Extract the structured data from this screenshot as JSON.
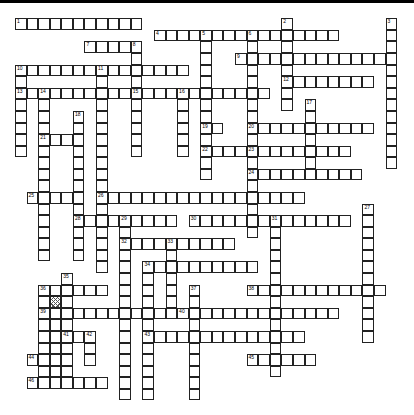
{
  "puzzle": {
    "grid": {
      "origin_x": 15,
      "origin_y": 18.3,
      "pitch": 11.58
    },
    "blocked_cells": [
      {
        "r": 24,
        "c": 3
      }
    ],
    "entries": [
      {
        "num": "1",
        "dir": "across",
        "r": 0,
        "c": 0,
        "len": 11
      },
      {
        "num": "2",
        "dir": "down",
        "r": 0,
        "c": 23,
        "len": 8
      },
      {
        "num": "3",
        "dir": "down",
        "r": 0,
        "c": 32,
        "len": 13
      },
      {
        "num": "4",
        "dir": "across",
        "r": 1,
        "c": 12,
        "len": 16
      },
      {
        "num": "5",
        "dir": "down",
        "r": 1,
        "c": 16,
        "len": 13
      },
      {
        "num": "6",
        "dir": "down",
        "r": 1,
        "c": 20,
        "len": 18
      },
      {
        "num": "7",
        "dir": "across",
        "r": 2,
        "c": 6,
        "len": 5
      },
      {
        "num": "8",
        "dir": "down",
        "r": 2,
        "c": 10,
        "len": 9
      },
      {
        "num": "9",
        "dir": "across",
        "r": 3,
        "c": 19,
        "len": 14
      },
      {
        "num": "10",
        "dir": "across",
        "r": 4,
        "c": 0,
        "len": 15
      },
      {
        "num": "11",
        "dir": "down",
        "r": 4,
        "c": 7,
        "len": 18
      },
      {
        "num": "12",
        "dir": "across",
        "r": 5,
        "c": 23,
        "len": 8
      },
      {
        "num": "13",
        "dir": "across",
        "r": 6,
        "c": 0,
        "len": 10
      },
      {
        "num": "14",
        "dir": "down",
        "r": 6,
        "c": 2,
        "len": 15
      },
      {
        "num": "15",
        "dir": "across",
        "r": 6,
        "c": 10,
        "len": 12
      },
      {
        "num": "16",
        "dir": "down",
        "r": 6,
        "c": 14,
        "len": 6
      },
      {
        "num": "17",
        "dir": "down",
        "r": 7,
        "c": 25,
        "len": 7
      },
      {
        "num": "18",
        "dir": "down",
        "r": 8,
        "c": 5,
        "len": 13
      },
      {
        "num": "19",
        "dir": "across",
        "r": 9,
        "c": 16,
        "len": 2
      },
      {
        "num": "20",
        "dir": "across",
        "r": 9,
        "c": 20,
        "len": 11
      },
      {
        "num": "21",
        "dir": "across",
        "r": 10,
        "c": 2,
        "len": 4
      },
      {
        "num": "22",
        "dir": "across",
        "r": 11,
        "c": 16,
        "len": 13
      },
      {
        "num": "23",
        "dir": "down",
        "r": 11,
        "c": 20,
        "len": 6
      },
      {
        "num": "24",
        "dir": "across",
        "r": 13,
        "c": 20,
        "len": 10
      },
      {
        "num": "25",
        "dir": "across",
        "r": 15,
        "c": 1,
        "len": 5
      },
      {
        "num": "26",
        "dir": "across",
        "r": 15,
        "c": 7,
        "len": 18
      },
      {
        "num": "27",
        "dir": "down",
        "r": 16,
        "c": 30,
        "len": 12
      },
      {
        "num": "28",
        "dir": "across",
        "r": 17,
        "c": 5,
        "len": 4
      },
      {
        "num": "29",
        "dir": "across",
        "r": 17,
        "c": 9,
        "len": 5
      },
      {
        "num": "30",
        "dir": "across",
        "r": 17,
        "c": 15,
        "len": 14
      },
      {
        "num": "31",
        "dir": "down",
        "r": 17,
        "c": 22,
        "len": 14
      },
      {
        "num": "32",
        "dir": "across",
        "r": 19,
        "c": 9,
        "len": 10
      },
      {
        "num": "33",
        "dir": "down",
        "r": 19,
        "c": 13,
        "len": 6
      },
      {
        "num": "34",
        "dir": "across",
        "r": 21,
        "c": 11,
        "len": 10
      },
      {
        "num": "35",
        "dir": "down",
        "r": 22,
        "c": 4,
        "len": 8
      },
      {
        "num": "36",
        "dir": "across",
        "r": 23,
        "c": 2,
        "len": 6
      },
      {
        "num": "37",
        "dir": "down",
        "r": 23,
        "c": 15,
        "len": 10
      },
      {
        "num": "38",
        "dir": "across",
        "r": 23,
        "c": 20,
        "len": 12
      },
      {
        "num": "39",
        "dir": "across",
        "r": 25,
        "c": 2,
        "len": 16
      },
      {
        "num": "40",
        "dir": "across",
        "r": 25,
        "c": 14,
        "len": 14
      },
      {
        "num": "41",
        "dir": "across",
        "r": 27,
        "c": 4,
        "len": 2
      },
      {
        "num": "42",
        "dir": "down",
        "r": 27,
        "c": 6,
        "len": 3
      },
      {
        "num": "43",
        "dir": "across",
        "r": 27,
        "c": 11,
        "len": 14
      },
      {
        "num": "44",
        "dir": "across",
        "r": 29,
        "c": 1,
        "len": 4
      },
      {
        "num": "45",
        "dir": "across",
        "r": 29,
        "c": 20,
        "len": 6
      },
      {
        "num": "46",
        "dir": "across",
        "r": 31,
        "c": 1,
        "len": 7
      }
    ],
    "extra_down_runs": [
      {
        "r": 4,
        "c": 0,
        "len": 8
      },
      {
        "r": 10,
        "c": 5,
        "len": 1
      },
      {
        "r": 15,
        "c": 5,
        "len": 3
      },
      {
        "r": 9,
        "c": 10,
        "len": 3
      },
      {
        "r": 17,
        "c": 9,
        "len": 16
      },
      {
        "r": 21,
        "c": 11,
        "len": 12
      },
      {
        "r": 15,
        "c": 3,
        "len": 1
      },
      {
        "r": 23,
        "c": 2,
        "len": 9
      },
      {
        "r": 23,
        "c": 3,
        "len": 9
      },
      {
        "r": 27,
        "c": 4,
        "len": 5
      },
      {
        "r": 13,
        "c": 26,
        "len": 1
      }
    ]
  }
}
